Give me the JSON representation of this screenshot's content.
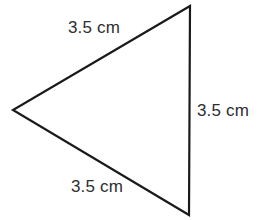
{
  "figure": {
    "type": "triangle",
    "background_color": "#ffffff",
    "stroke_color": "#1a1a1a",
    "stroke_width": 2.2,
    "text_color": "#2e2e2e",
    "vertices": {
      "top": {
        "x": 190,
        "y": 6
      },
      "left": {
        "x": 13,
        "y": 110
      },
      "bottom": {
        "x": 189,
        "y": 215
      }
    },
    "labels": {
      "upper_left_side": "3.5 cm",
      "right_side": "3.5 cm",
      "bottom_side": "3.5 cm"
    }
  }
}
